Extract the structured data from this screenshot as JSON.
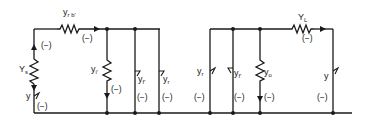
{
  "diagram": {
    "type": "equivalent-circuit",
    "colors": {
      "ink": "#1a1a1a",
      "background": "#ffffff"
    },
    "sections": [
      {
        "id": "input",
        "elements": [
          {
            "id": "Ys",
            "kind": "resistor",
            "orientation": "vertical",
            "label_main": "Y",
            "label_sub": "s",
            "sign": "(−)"
          },
          {
            "id": "y_src",
            "kind": "current-source",
            "label_main": "y",
            "label_sub": "",
            "sign": "(−)"
          },
          {
            "id": "yrb",
            "kind": "resistor",
            "orientation": "horizontal",
            "label_main": "y",
            "label_sub": "r b'",
            "sign": "(−)"
          },
          {
            "id": "yi",
            "kind": "resistor",
            "orientation": "vertical",
            "label_main": "y",
            "label_sub": "i'",
            "sign": "(−)"
          },
          {
            "id": "yf1",
            "kind": "current-source",
            "label_main": "y",
            "label_sub": "f'",
            "sign": "(−)"
          },
          {
            "id": "yr1",
            "kind": "current-source",
            "label_main": "y",
            "label_sub": "r",
            "sign": "(−)"
          }
        ]
      },
      {
        "id": "output",
        "elements": [
          {
            "id": "yr2",
            "kind": "current-source",
            "label_main": "y",
            "label_sub": "r",
            "sign": "(−)"
          },
          {
            "id": "yf2",
            "kind": "current-source",
            "label_main": "y",
            "label_sub": "f'",
            "sign": "(−)"
          },
          {
            "id": "yo",
            "kind": "resistor",
            "orientation": "vertical",
            "label_main": "y",
            "label_sub": "o",
            "sign": "(−)"
          },
          {
            "id": "YL",
            "kind": "resistor",
            "orientation": "horizontal",
            "label_main": "Y",
            "label_sub": "L",
            "sign": "(−)"
          },
          {
            "id": "y_out",
            "kind": "current-source",
            "label_main": "y",
            "label_sub": "",
            "sign": "(−)"
          }
        ]
      }
    ],
    "sign_top_left": "(−)"
  }
}
